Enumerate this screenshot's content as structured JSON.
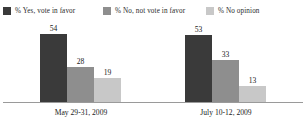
{
  "chart_data": {
    "type": "bar",
    "title": "",
    "subtitle": "",
    "xlabel": "",
    "ylabel": "",
    "ylim": [
      0,
      60
    ],
    "grid": false,
    "legend_position": "top",
    "orientation": "vertical",
    "grouping": "grouped",
    "categories": [
      "May 29-31, 2009",
      "July 10-12, 2009"
    ],
    "series": [
      {
        "name": "% Yes, vote in favor",
        "color": "#3a3a3a",
        "values": [
          54,
          28
        ]
      },
      {
        "name": "% No, not vote in favor",
        "color": "#8e8e8e",
        "values": [
          33,
          33
        ]
      },
      {
        "name": "% No opinion",
        "color": "#c8c8c8",
        "values": [
          19,
          13
        ]
      }
    ],
    "groups": [
      {
        "category": "May 29-31, 2009",
        "bars": [
          {
            "series": "% Yes, vote in favor",
            "value": 54,
            "label": "54",
            "color": "#3a3a3a"
          },
          {
            "series": "% No, not vote in favor",
            "value": 28,
            "label": "28",
            "color": "#8e8e8e"
          },
          {
            "series": "% No opinion",
            "value": 19,
            "label": "19",
            "color": "#c8c8c8"
          }
        ]
      },
      {
        "category": "July 10-12, 2009",
        "bars": [
          {
            "series": "% Yes, vote in favor",
            "value": 53,
            "label": "53",
            "color": "#3a3a3a"
          },
          {
            "series": "% No, not vote in favor",
            "value": 33,
            "label": "33",
            "color": "#8e8e8e"
          },
          {
            "series": "% No opinion",
            "value": 13,
            "label": "13",
            "color": "#c8c8c8"
          }
        ]
      }
    ],
    "annotations": []
  },
  "legend": {
    "items": [
      {
        "label": "% Yes, vote in favor",
        "color": "#3a3a3a"
      },
      {
        "label": "% No, not vote in favor",
        "color": "#8e8e8e"
      },
      {
        "label": "% No opinion",
        "color": "#c8c8c8"
      }
    ]
  },
  "axis": {
    "baseline_color": "#9a9a9a"
  },
  "top_sliver": {
    "text": ""
  }
}
